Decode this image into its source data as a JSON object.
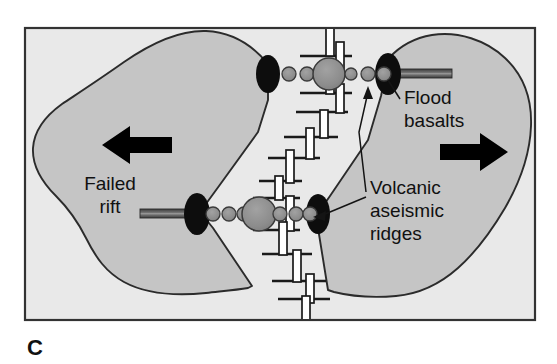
{
  "figure": {
    "panel_letter": "C",
    "caption_text": "",
    "frame": {
      "x": 25,
      "y": 28,
      "width": 510,
      "height": 292
    },
    "colors": {
      "page_background": "#ffffff",
      "ocean_background": "#e9e9e9",
      "continent_fill": "#c5c5c5",
      "continent_outline": "#2b2b2b",
      "ridge_axis_fill": "#ffffff",
      "transform_fault": "#1a1a1a",
      "hotspot_black": "#0d0d0d",
      "volcano_gray": "#8e8e8e",
      "volcano_outline": "#3a3a3a",
      "rift_bar": "#555555",
      "arrow_black": "#000000",
      "frame_border": "#333333",
      "text": "#111111"
    }
  },
  "labels": [
    {
      "id": "flood-basalts",
      "lines": [
        "Flood",
        "basalts"
      ],
      "x": 404,
      "y": 104,
      "anchor": "start"
    },
    {
      "id": "volcanic-aseismic-ridges",
      "lines": [
        "Volcanic",
        "aseismic",
        "ridges"
      ],
      "x": 370,
      "y": 194,
      "anchor": "start"
    },
    {
      "id": "failed-rift",
      "lines": [
        "Failed",
        "rift"
      ],
      "x": 110,
      "y": 190,
      "anchor": "middle"
    }
  ],
  "arrows": [
    {
      "id": "left-plate-motion",
      "direction": "left",
      "x": 105,
      "y": 145
    },
    {
      "id": "right-plate-motion",
      "direction": "right",
      "x": 455,
      "y": 152
    }
  ],
  "hotspot_chains": [
    {
      "id": "upper-chain",
      "y": 74,
      "left_lens": {
        "x": 268,
        "rx": 12,
        "ry": 19
      },
      "right_lens": {
        "x": 388,
        "rx": 13,
        "ry": 21
      },
      "main_volcano": {
        "x": 329,
        "r": 16
      },
      "volcanoes": [
        {
          "x": 289,
          "r": 7
        },
        {
          "x": 307,
          "r": 7
        },
        {
          "x": 351,
          "r": 6
        },
        {
          "x": 368,
          "r": 7
        },
        {
          "x": 384,
          "r": 7
        }
      ],
      "rift_bar": {
        "x1": 398,
        "x2": 452,
        "y": 74
      }
    },
    {
      "id": "lower-chain",
      "y": 214,
      "left_lens": {
        "x": 197,
        "rx": 13,
        "ry": 21
      },
      "right_lens": {
        "x": 318,
        "rx": 12,
        "ry": 20
      },
      "main_volcano": {
        "x": 259,
        "r": 17
      },
      "volcanoes": [
        {
          "x": 213,
          "r": 7
        },
        {
          "x": 229,
          "r": 7
        },
        {
          "x": 244,
          "r": 7
        },
        {
          "x": 280,
          "r": 7
        },
        {
          "x": 296,
          "r": 7
        },
        {
          "x": 310,
          "r": 7
        }
      ],
      "rift_bar": {
        "x1": 140,
        "x2": 190,
        "y": 214
      }
    }
  ],
  "ridge_axes": [
    {
      "id": "ridge-seg-1",
      "x": 330,
      "y1": 28,
      "y2": 55
    },
    {
      "id": "ridge-seg-2",
      "x": 340,
      "y1": 42,
      "y2": 68
    },
    {
      "id": "ridge-seg-3",
      "x": 330,
      "y1": 62,
      "y2": 92
    },
    {
      "id": "ridge-seg-4",
      "x": 340,
      "y1": 84,
      "y2": 112
    },
    {
      "id": "ridge-seg-5",
      "x": 324,
      "y1": 110,
      "y2": 136
    },
    {
      "id": "ridge-seg-6",
      "x": 310,
      "y1": 128,
      "y2": 158
    },
    {
      "id": "ridge-seg-7",
      "x": 290,
      "y1": 150,
      "y2": 182
    },
    {
      "id": "ridge-seg-8",
      "x": 279,
      "y1": 176,
      "y2": 200
    },
    {
      "id": "ridge-seg-9",
      "x": 290,
      "y1": 196,
      "y2": 226
    },
    {
      "id": "ridge-seg-10",
      "x": 283,
      "y1": 222,
      "y2": 254
    },
    {
      "id": "ridge-seg-11",
      "x": 297,
      "y1": 250,
      "y2": 280
    },
    {
      "id": "ridge-seg-12",
      "x": 310,
      "y1": 274,
      "y2": 302
    },
    {
      "id": "ridge-seg-13",
      "x": 306,
      "y1": 296,
      "y2": 320
    }
  ],
  "transform_faults": [
    {
      "id": "tf-1",
      "y": 56,
      "x1": 300,
      "x2": 352
    },
    {
      "id": "tf-2",
      "y": 93,
      "x1": 300,
      "x2": 352
    },
    {
      "id": "tf-3",
      "y": 112,
      "x1": 296,
      "x2": 348
    },
    {
      "id": "tf-4",
      "y": 137,
      "x1": 284,
      "x2": 338
    },
    {
      "id": "tf-5",
      "y": 158,
      "x1": 268,
      "x2": 320
    },
    {
      "id": "tf-6",
      "y": 181,
      "x1": 259,
      "x2": 302
    },
    {
      "id": "tf-7",
      "y": 198,
      "x1": 253,
      "x2": 300
    },
    {
      "id": "tf-8",
      "y": 230,
      "x1": 253,
      "x2": 300
    },
    {
      "id": "tf-9",
      "y": 254,
      "x1": 262,
      "x2": 312
    },
    {
      "id": "tf-10",
      "y": 281,
      "x1": 272,
      "x2": 326
    },
    {
      "id": "tf-11",
      "y": 299,
      "x1": 278,
      "x2": 330
    }
  ]
}
